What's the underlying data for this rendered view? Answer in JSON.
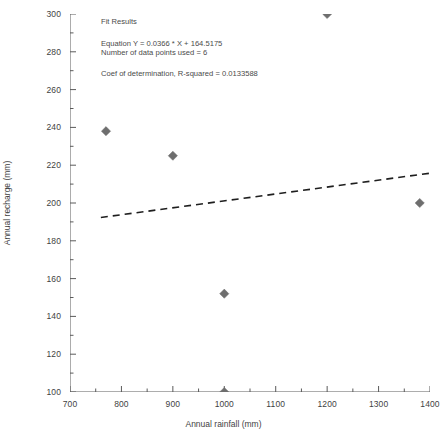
{
  "chart_data": {
    "type": "scatter",
    "title": "",
    "xlabel": "Annual rainfall (mm)",
    "ylabel": "Annual recharge (mm)",
    "xlim": [
      700,
      1400
    ],
    "ylim": [
      100,
      300
    ],
    "xticks": [
      700,
      800,
      900,
      1000,
      1100,
      1200,
      1300,
      1400
    ],
    "yticks": [
      100,
      120,
      140,
      160,
      180,
      200,
      220,
      240,
      260,
      280,
      300
    ],
    "xtick_labels": [
      "700",
      "800",
      "900",
      "1000",
      "1100",
      "1200",
      "1300",
      "1400"
    ],
    "ytick_labels": [
      "100",
      "120",
      "140",
      "160",
      "180",
      "200",
      "220",
      "240",
      "260",
      "280",
      "300"
    ],
    "minor_ticks": true,
    "grid": false,
    "legend": false,
    "marker": "diamond",
    "marker_color": "#6e6e6e",
    "points": [
      {
        "x": 770,
        "y": 238
      },
      {
        "x": 900,
        "y": 225
      },
      {
        "x": 1000,
        "y": 152
      },
      {
        "x": 1000,
        "y": 100
      },
      {
        "x": 1200,
        "y": 300
      },
      {
        "x": 1380,
        "y": 200
      }
    ],
    "series": [
      {
        "name": "data",
        "x": [
          770,
          900,
          1000,
          1000,
          1200,
          1380
        ],
        "values": [
          238,
          225,
          152,
          100,
          300,
          200
        ]
      }
    ],
    "fit_line": {
      "style": "dashed",
      "color": "#1f1f1f",
      "slope": 0.0366,
      "intercept": 164.5175,
      "x_start": 760,
      "x_end": 1400,
      "y_start": 192.33,
      "y_end": 215.76
    },
    "annotations": {
      "title": "Fit Results",
      "equation": "Equation Y = 0.0366 * X + 164.5175",
      "npoints": "Number of data points used = 6",
      "rsquared": "Coef of determination, R-squared = 0.0133588"
    }
  }
}
